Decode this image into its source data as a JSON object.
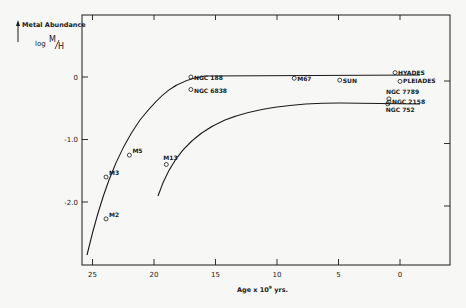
{
  "chart_data": {
    "type": "scatter",
    "title": "Metal Abundance",
    "ylabel": "log M/H",
    "xlabel": "Age x 10^9 yrs.",
    "xlim": [
      26,
      -4
    ],
    "ylim": [
      -3.05,
      0.95
    ],
    "x_ticks": [
      25,
      20,
      15,
      10,
      5,
      0
    ],
    "x_tick_labels": [
      "25",
      "20",
      "15",
      "10",
      "5",
      "0"
    ],
    "y_ticks": [
      0,
      -1.0,
      -2.0
    ],
    "y_tick_labels": [
      "0",
      "-1.0",
      "-2.0"
    ],
    "grid": false,
    "points": [
      {
        "name": "M2",
        "age": 23.9,
        "log_m_h": -2.27
      },
      {
        "name": "M3",
        "age": 23.9,
        "log_m_h": -1.6
      },
      {
        "name": "M5",
        "age": 22.0,
        "log_m_h": -1.25
      },
      {
        "name": "M13",
        "age": 19.0,
        "log_m_h": -1.4
      },
      {
        "name": "NGC 188",
        "age": 17.0,
        "log_m_h": 0.0
      },
      {
        "name": "NGC 6838",
        "age": 17.0,
        "log_m_h": -0.2
      },
      {
        "name": "M67",
        "age": 8.6,
        "log_m_h": -0.02
      },
      {
        "name": "SUN",
        "age": 4.9,
        "log_m_h": -0.05
      },
      {
        "name": "HYADES",
        "age": 0.4,
        "log_m_h": 0.07
      },
      {
        "name": "PLEIADES",
        "age": 0.0,
        "log_m_h": -0.07
      },
      {
        "name": "NGC 7789",
        "age": 0.9,
        "log_m_h": -0.35
      },
      {
        "name": "NGC 2158",
        "age": 0.9,
        "log_m_h": -0.4
      },
      {
        "name": "NGC 752",
        "age": 1.0,
        "log_m_h": -0.43
      }
    ],
    "curves": [
      {
        "name": "upper-curve",
        "description": "rises from about (25.6,-2.4) to plateau near 0.1 at age < 17"
      },
      {
        "name": "lower-curve",
        "description": "rises from about (19.4,-1.95) to plateau near -0.4 at age < 8"
      }
    ]
  },
  "labels": {
    "title": "Metal Abundance",
    "ylabel_log": "log",
    "ylabel_m": "M",
    "ylabel_h": "H",
    "xlabel": "Age x 10",
    "xlabel_exp": "9",
    "xlabel_suffix": " yrs."
  }
}
